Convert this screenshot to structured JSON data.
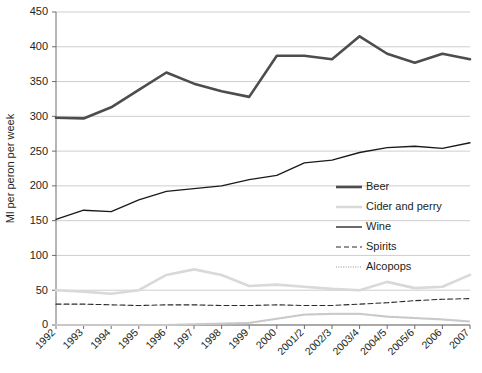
{
  "chart_data": {
    "type": "line",
    "title": "",
    "xlabel": "",
    "ylabel": "Ml per peron per week",
    "ylim": [
      0,
      450
    ],
    "yticks": [
      0,
      50,
      100,
      150,
      200,
      250,
      300,
      350,
      400,
      450
    ],
    "grid": true,
    "legend_position": "right-middle",
    "categories": [
      "1992",
      "1993",
      "1994",
      "1995",
      "1996",
      "1997",
      "1998",
      "1999",
      "2000",
      "2001/2",
      "2002/3",
      "2003/4",
      "2004/5",
      "2005/6",
      "2006",
      "2007"
    ],
    "series": [
      {
        "name": "Beer",
        "color": "#4d4d4d",
        "style": "solid-thick",
        "values": [
          298,
          297,
          313,
          338,
          363,
          347,
          336,
          328,
          387,
          387,
          382,
          415,
          390,
          377,
          390,
          382
        ]
      },
      {
        "name": "Cider and perry",
        "color": "#d9d9d9",
        "style": "solid-thick",
        "values": [
          50,
          48,
          45,
          50,
          72,
          80,
          72,
          56,
          58,
          55,
          52,
          50,
          62,
          53,
          55,
          72
        ]
      },
      {
        "name": "Wine",
        "color": "#1a1a1a",
        "style": "solid-thin",
        "values": [
          152,
          165,
          163,
          180,
          192,
          196,
          200,
          209,
          215,
          233,
          237,
          248,
          255,
          257,
          254,
          262
        ]
      },
      {
        "name": "Spirits",
        "color": "#2b2b2b",
        "style": "dashed",
        "values": [
          30,
          30,
          29,
          28,
          29,
          29,
          28,
          28,
          29,
          28,
          28,
          30,
          32,
          35,
          37,
          38
        ]
      },
      {
        "name": "Alcopops",
        "color": "#c9c9c9",
        "style": "dotted",
        "values": [
          0,
          0,
          0,
          0,
          0,
          1,
          2,
          3,
          9,
          15,
          16,
          16,
          12,
          10,
          8,
          5
        ]
      }
    ]
  },
  "legend": {
    "items": [
      {
        "label": "Beer"
      },
      {
        "label": "Cider and perry"
      },
      {
        "label": "Wine"
      },
      {
        "label": "Spirits"
      },
      {
        "label": "Alcopops"
      }
    ]
  },
  "axes": {
    "y_title": "Ml per peron per week"
  }
}
